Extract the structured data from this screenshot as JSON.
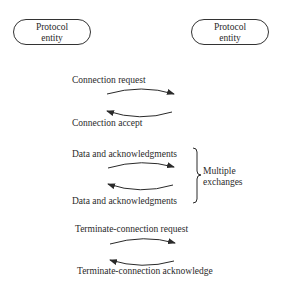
{
  "entities": {
    "left": {
      "line1": "Protocol",
      "line2": "entity"
    },
    "right": {
      "line1": "Protocol",
      "line2": "entity"
    }
  },
  "messages": [
    {
      "label": "Connection request",
      "direction": "left-to-right"
    },
    {
      "label": "Connection accept",
      "direction": "right-to-left"
    },
    {
      "label": "Data and acknowledgments",
      "direction": "left-to-right"
    },
    {
      "label": "Data and acknowledgments",
      "direction": "right-to-left"
    },
    {
      "label": "Terminate-connection request",
      "direction": "left-to-right"
    },
    {
      "label": "Terminate-connection acknowledge",
      "direction": "right-to-left"
    }
  ],
  "brace": {
    "line1": "Multiple",
    "line2": "exchanges"
  },
  "colors": {
    "ink": "#2a2a2a",
    "background": "#ffffff"
  }
}
